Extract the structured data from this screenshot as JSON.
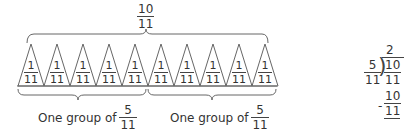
{
  "diagram": {
    "total": {
      "numerator": "10",
      "denominator": "11"
    },
    "unit_piece": {
      "numerator": "1",
      "denominator": "11"
    },
    "piece_count": 10,
    "groups": [
      {
        "label": "One group of",
        "numerator": "5",
        "denominator": "11"
      },
      {
        "label": "One group of",
        "numerator": "5",
        "denominator": "11"
      }
    ],
    "pieces": [
      {
        "numerator": "1",
        "denominator": "11"
      },
      {
        "numerator": "1",
        "denominator": "11"
      },
      {
        "numerator": "1",
        "denominator": "11"
      },
      {
        "numerator": "1",
        "denominator": "11"
      },
      {
        "numerator": "1",
        "denominator": "11"
      },
      {
        "numerator": "1",
        "denominator": "11"
      },
      {
        "numerator": "1",
        "denominator": "11"
      },
      {
        "numerator": "1",
        "denominator": "11"
      },
      {
        "numerator": "1",
        "denominator": "11"
      },
      {
        "numerator": "1",
        "denominator": "11"
      }
    ]
  },
  "division": {
    "quotient": "2",
    "divisor": {
      "numerator": "5",
      "denominator": "11"
    },
    "dividend": {
      "numerator": "10",
      "denominator": "11"
    },
    "minus_sign": "-",
    "product": {
      "numerator": "10",
      "denominator": "11"
    }
  },
  "colors": {
    "stroke": "#555555",
    "text": "#333333",
    "background": "#ffffff"
  }
}
